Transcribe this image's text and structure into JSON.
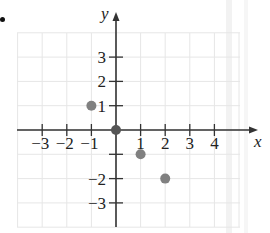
{
  "figure": {
    "bullet": "•",
    "x_axis_label": "x",
    "y_axis_label": "y"
  },
  "chart_data": {
    "type": "scatter",
    "title": "",
    "xlabel": "x",
    "ylabel": "y",
    "xlim": [
      -4,
      5
    ],
    "ylim": [
      -4,
      4
    ],
    "grid": true,
    "x_ticks": [
      -3,
      -2,
      -1,
      1,
      2,
      3,
      4
    ],
    "y_ticks": [
      3,
      2,
      1,
      -1,
      -2,
      -3
    ],
    "x_tick_labels": [
      "−3",
      "−2",
      "−1",
      "1",
      "2",
      "3",
      "4"
    ],
    "y_tick_labels": [
      "3",
      "2",
      "1",
      "",
      "−2",
      "−3"
    ],
    "points": [
      {
        "x": -1,
        "y": 1
      },
      {
        "x": 0,
        "y": 0
      },
      {
        "x": 1,
        "y": -1
      },
      {
        "x": 2,
        "y": -2
      }
    ],
    "point_color": "#808080",
    "origin_point_color": "#555555",
    "axis_color": "#333333",
    "grid_color": "#e6e6e6"
  }
}
